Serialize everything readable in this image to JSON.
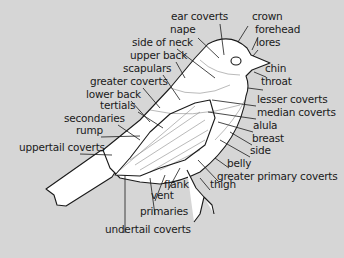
{
  "colors": {
    "background": "#d6d6d6",
    "bird_fill": "#ffffff",
    "line": "#1a1a1a",
    "text": "#1a1a1a"
  },
  "labels": [
    {
      "text": "ear coverts",
      "x": 171,
      "y": 19
    },
    {
      "text": "crown",
      "x": 252,
      "y": 19
    },
    {
      "text": "nape",
      "x": 170,
      "y": 32
    },
    {
      "text": "forehead",
      "x": 255,
      "y": 32
    },
    {
      "text": "side of neck",
      "x": 132,
      "y": 45
    },
    {
      "text": "lores",
      "x": 256,
      "y": 45
    },
    {
      "text": "upper back",
      "x": 130,
      "y": 58
    },
    {
      "text": "scapulars",
      "x": 123,
      "y": 71
    },
    {
      "text": "chin",
      "x": 265,
      "y": 71
    },
    {
      "text": "greater coverts",
      "x": 90,
      "y": 84
    },
    {
      "text": "throat",
      "x": 261,
      "y": 84
    },
    {
      "text": "lower back",
      "x": 86,
      "y": 97
    },
    {
      "text": "tertials",
      "x": 100,
      "y": 108
    },
    {
      "text": "lesser coverts",
      "x": 257,
      "y": 102
    },
    {
      "text": "secondaries",
      "x": 64,
      "y": 121
    },
    {
      "text": "median coverts",
      "x": 257,
      "y": 115
    },
    {
      "text": "rump",
      "x": 76,
      "y": 133
    },
    {
      "text": "alula",
      "x": 253,
      "y": 128
    },
    {
      "text": "breast",
      "x": 252,
      "y": 141
    },
    {
      "text": "uppertail coverts",
      "x": 19,
      "y": 150
    },
    {
      "text": "side",
      "x": 250,
      "y": 153
    },
    {
      "text": "belly",
      "x": 227,
      "y": 166
    },
    {
      "text": "greater primary coverts",
      "x": 217,
      "y": 179
    },
    {
      "text": "flank",
      "x": 164,
      "y": 187
    },
    {
      "text": "thigh",
      "x": 210,
      "y": 187
    },
    {
      "text": "vent",
      "x": 151,
      "y": 198
    },
    {
      "text": "primaries",
      "x": 140,
      "y": 214
    },
    {
      "text": "undertail coverts",
      "x": 105,
      "y": 232
    }
  ]
}
